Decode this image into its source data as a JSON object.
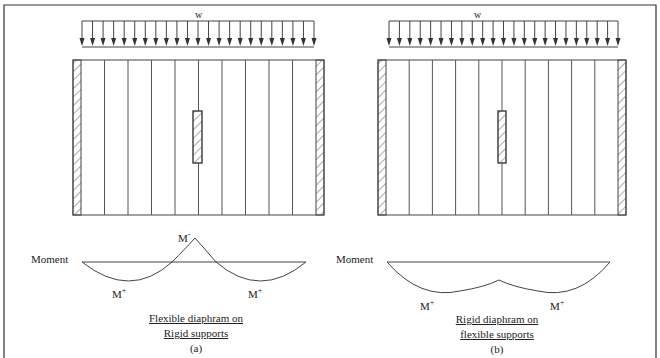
{
  "figure": {
    "top_caption_clipped": "Figure ... diaphragm ...",
    "frame_color": "#333333",
    "line_color": "#444444"
  },
  "panels": [
    {
      "id": "a",
      "load_label": "w",
      "moment_label": "Moment",
      "negative_moment": {
        "base": "M",
        "sign": "-"
      },
      "positive_moment_left": {
        "base": "M",
        "sign": "+"
      },
      "positive_moment_right": {
        "base": "M",
        "sign": "+"
      },
      "caption_line1": "Flexible diaphram on",
      "caption_line2": "Rigid supports",
      "panel_label": "(a)"
    },
    {
      "id": "b",
      "load_label": "w",
      "moment_label": "Moment",
      "positive_moment_left": {
        "base": "M",
        "sign": "+"
      },
      "positive_moment_right": {
        "base": "M",
        "sign": "+"
      },
      "caption_line1": "Rigid diaphram on",
      "caption_line2": "flexible supports",
      "panel_label": "(b)"
    }
  ]
}
